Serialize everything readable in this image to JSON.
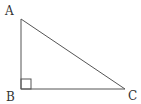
{
  "diagram": {
    "type": "right-triangle",
    "right_angle_at": "B",
    "stroke_color": "#555555",
    "vertices": [
      {
        "label": "A",
        "x": 21,
        "y": 19
      },
      {
        "label": "B",
        "x": 21,
        "y": 89
      },
      {
        "label": "C",
        "x": 125,
        "y": 89
      }
    ],
    "labels": {
      "a": "A",
      "b": "B",
      "c": "C"
    }
  }
}
